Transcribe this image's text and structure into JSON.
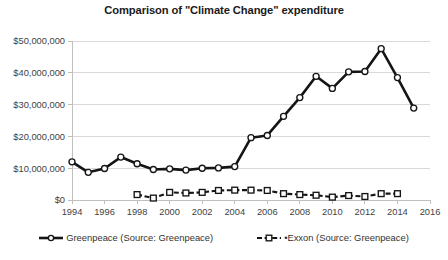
{
  "chart_data": {
    "type": "line",
    "title": "Comparison of \"Climate Change\" expenditure",
    "xlabel": "",
    "ylabel": "",
    "grid": true,
    "legend_position": "bottom",
    "x": [
      1994,
      1995,
      1996,
      1997,
      1998,
      1999,
      2000,
      2001,
      2002,
      2003,
      2004,
      2005,
      2006,
      2007,
      2008,
      2009,
      2010,
      2011,
      2012,
      2013,
      2014,
      2015
    ],
    "xlim": [
      1994,
      2016
    ],
    "ylim": [
      0,
      50000000
    ],
    "xticks": [
      1994,
      1996,
      1998,
      2000,
      2002,
      2004,
      2006,
      2008,
      2010,
      2012,
      2014,
      2016
    ],
    "xtick_labels": [
      "1994",
      "1996",
      "1998",
      "2000",
      "2002",
      "2004",
      "2006",
      "2008",
      "2010",
      "2012",
      "2014",
      "2016"
    ],
    "yticks": [
      0,
      10000000,
      20000000,
      30000000,
      40000000,
      50000000
    ],
    "ytick_labels": [
      "$0",
      "$10,000,000",
      "$20,000,000",
      "$30,000,000",
      "$40,000,000",
      "$50,000,000"
    ],
    "series": [
      {
        "name": "Greenpeace (Source: Greenpeace)",
        "marker": "circle",
        "linestyle": "solid",
        "color": "#151515",
        "x": [
          1994,
          1995,
          1996,
          1997,
          1998,
          1999,
          2000,
          2001,
          2002,
          2003,
          2004,
          2005,
          2006,
          2007,
          2008,
          2009,
          2010,
          2011,
          2012,
          2013,
          2014,
          2015
        ],
        "values": [
          12000000,
          8700000,
          9900000,
          13500000,
          11400000,
          9600000,
          9800000,
          9400000,
          10000000,
          10100000,
          10500000,
          19600000,
          20300000,
          26300000,
          32200000,
          38900000,
          35100000,
          40300000,
          40400000,
          47600000,
          38500000,
          28900000
        ]
      },
      {
        "name": "•Exxon (Source: Greenpeace)",
        "marker": "square",
        "linestyle": "dashed",
        "color": "#151515",
        "x": [
          1998,
          1999,
          2000,
          2001,
          2002,
          2003,
          2004,
          2005,
          2006,
          2007,
          2008,
          2009,
          2010,
          2011,
          2012,
          2013,
          2014
        ],
        "values": [
          1700000,
          600000,
          2400000,
          2200000,
          2400000,
          3000000,
          3100000,
          3100000,
          3000000,
          2000000,
          1700000,
          1500000,
          900000,
          1400000,
          1100000,
          2000000,
          2000000
        ]
      }
    ]
  },
  "legend": {
    "entries": [
      {
        "label": "Greenpeace (Source: Greenpeace)",
        "marker": "circle",
        "style": "solid"
      },
      {
        "label": "•Exxon (Source: Greenpeace)",
        "marker": "square",
        "style": "dashed"
      }
    ]
  }
}
